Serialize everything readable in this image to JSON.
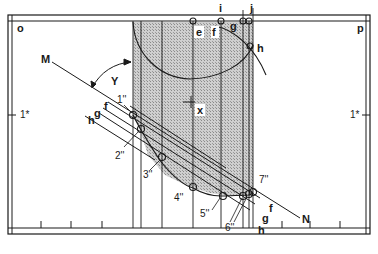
{
  "colors": {
    "line": "#1a1a1a",
    "shade": "#b8b8b8",
    "background": "#ffffff"
  },
  "labels": {
    "corner_left": "o",
    "corner_right": "p",
    "scale_left": "1*",
    "scale_right": "1*",
    "line_start": "M",
    "line_end": "N",
    "angle": "Y",
    "center": "x",
    "top_e": "e",
    "top_f": "f",
    "top_g": "g",
    "top_h": "h",
    "top_i": "i",
    "top_j": "j",
    "left_f": "f",
    "left_g": "g",
    "left_h": "h",
    "right_f": "f",
    "right_g": "g",
    "right_h": "h",
    "p1": "1''",
    "p2": "2''",
    "p3": "3''",
    "p4": "4''",
    "p5": "5''",
    "p6": "6''",
    "p7": "7''"
  }
}
